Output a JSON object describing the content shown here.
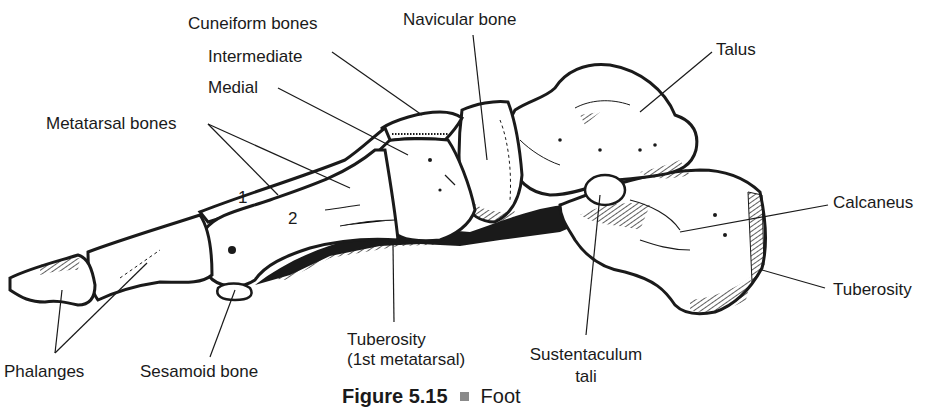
{
  "figure": {
    "number": "Figure 5.15",
    "separator_icon": "square-bullet-icon",
    "title": "Foot"
  },
  "labels": {
    "cuneiform_bones": "Cuneiform bones",
    "intermediate": "Intermediate",
    "medial": "Medial",
    "metatarsal_bones": "Metatarsal bones",
    "navicular_bone": "Navicular bone",
    "talus": "Talus",
    "calcaneus": "Calcaneus",
    "tuberosity_calcaneus": "Tuberosity",
    "phalanges": "Phalanges",
    "sesamoid_bone": "Sesamoid bone",
    "tuberosity_1st_line1": "Tuberosity",
    "tuberosity_1st_line2": "(1st metatarsal)",
    "sustentaculum_line1": "Sustentaculum",
    "sustentaculum_line2": "tali"
  },
  "bone_numbers": {
    "first_metatarsal": "1",
    "second_metatarsal": "2"
  },
  "colors": {
    "ink": "#1a1a1a",
    "bone_fill": "#ffffff",
    "background": "#ffffff",
    "separator": "#8a8a8a"
  }
}
